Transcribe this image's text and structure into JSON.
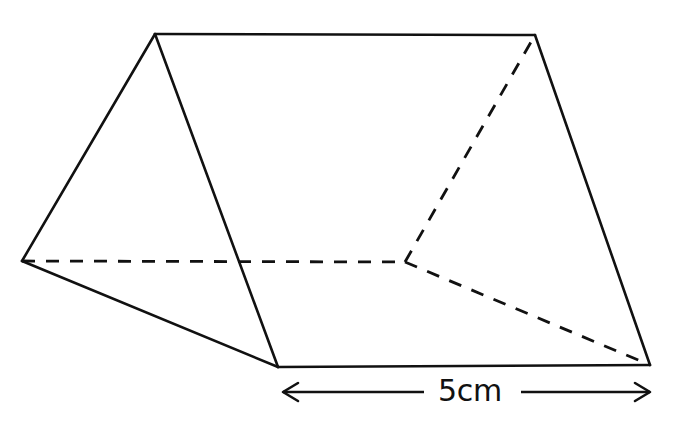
{
  "figure": {
    "kind": "triangular-prism",
    "background_color": "#ffffff",
    "stroke_color": "#111111",
    "solid_stroke_width": 2.6,
    "hidden_stroke_width": 2.8,
    "hidden_dash_pattern": "13 11",
    "vertices": {
      "front_apex": {
        "x": 155,
        "y": 34
      },
      "back_apex": {
        "x": 535,
        "y": 35
      },
      "front_left_base": {
        "x": 22,
        "y": 261
      },
      "hidden_back_base": {
        "x": 405,
        "y": 262
      },
      "front_bottom": {
        "x": 278,
        "y": 367
      },
      "back_bottom": {
        "x": 650,
        "y": 365
      }
    },
    "solid_edges": [
      {
        "name": "front-face-left-slant",
        "from": "front_left_base",
        "to": "front_apex"
      },
      {
        "name": "front-face-right-slant",
        "from": "front_apex",
        "to": "front_bottom"
      },
      {
        "name": "front-face-base",
        "from": "front_bottom",
        "to": "front_left_base"
      },
      {
        "name": "top-ridge",
        "from": "front_apex",
        "to": "back_apex"
      },
      {
        "name": "back-face-right-slant",
        "from": "back_apex",
        "to": "back_bottom"
      },
      {
        "name": "bottom-front-edge",
        "from": "front_bottom",
        "to": "back_bottom"
      }
    ],
    "hidden_edges": [
      {
        "name": "hidden-bottom-back-edge",
        "from": "front_left_base",
        "to": "hidden_back_base"
      },
      {
        "name": "hidden-back-left-slant",
        "from": "hidden_back_base",
        "to": "back_apex"
      },
      {
        "name": "hidden-back-base-edge",
        "from": "hidden_back_base",
        "to": "back_bottom"
      }
    ],
    "dimension": {
      "label": "5cm",
      "label_x": 470,
      "label_y": 392,
      "axis_y": 392,
      "left_end_x": 283,
      "right_end_x": 650,
      "gap_left_x": 424,
      "gap_right_x": 521,
      "arrowhead_length": 15,
      "arrowhead_spread": 9,
      "measures": "length of the prism"
    }
  }
}
